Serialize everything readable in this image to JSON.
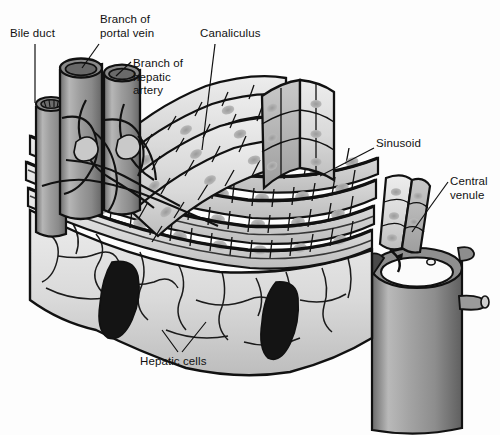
{
  "figure": {
    "background_color": "#fdfdfd",
    "ink_color": "#111111",
    "cell_fill": "#d8d8d8",
    "vessel_fill": "#9a9a9a",
    "void_fill": "#1a1a1a"
  },
  "labels": [
    {
      "id": "bile-duct",
      "text": "Bile duct",
      "x": 10,
      "y": 28,
      "lines": [
        "Bile duct"
      ]
    },
    {
      "id": "branch-portal-vein",
      "text": "Branch of\nportal vein",
      "x": 100,
      "y": 14,
      "lines": [
        "Branch of",
        "portal vein"
      ]
    },
    {
      "id": "branch-hepatic-artery",
      "text": "Branch of\nhepatic\nartery",
      "x": 133,
      "y": 58,
      "lines": [
        "Branch of",
        "hepatic",
        "artery"
      ]
    },
    {
      "id": "canaliculus",
      "text": "Canaliculus",
      "x": 200,
      "y": 28,
      "lines": [
        "Canaliculus"
      ]
    },
    {
      "id": "sinusoid",
      "text": "Sinusoid",
      "x": 376,
      "y": 138,
      "lines": [
        "Sinusoid"
      ]
    },
    {
      "id": "central-venule",
      "text": "Central\nvenule",
      "x": 450,
      "y": 176,
      "lines": [
        "Central",
        "venule"
      ]
    },
    {
      "id": "hepatic-cells",
      "text": "Hepatic cells",
      "x": 140,
      "y": 356,
      "lines": [
        "Hepatic cells"
      ]
    }
  ],
  "structures": [
    {
      "id": "bile-duct-vessel",
      "name": "bile duct",
      "kind": "cylinder"
    },
    {
      "id": "portal-vein-vessel",
      "name": "branch of portal vein",
      "kind": "cylinder"
    },
    {
      "id": "hepatic-artery-vessel",
      "name": "branch of hepatic artery",
      "kind": "cylinder"
    },
    {
      "id": "central-venule-vessel",
      "name": "central venule",
      "kind": "large-cylinder"
    },
    {
      "id": "hepatocyte-plates",
      "name": "hepatic cell plates",
      "kind": "cell-rows"
    },
    {
      "id": "sinusoid-channels",
      "name": "sinusoids",
      "kind": "channels"
    },
    {
      "id": "canaliculi-network",
      "name": "bile canaliculi",
      "kind": "tubule-network"
    }
  ]
}
